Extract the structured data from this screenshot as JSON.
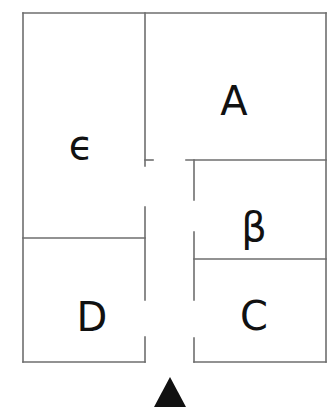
{
  "diagram": {
    "type": "floor-plan",
    "wall_color": "#6e6e6e",
    "label_color": "#111111",
    "marker_color": "#111111",
    "rooms": [
      {
        "id": "A",
        "label": "A",
        "cx": 234,
        "cy": 101
      },
      {
        "id": "B",
        "label": "β",
        "cx": 254,
        "cy": 227
      },
      {
        "id": "C",
        "label": "C",
        "cx": 254,
        "cy": 316
      },
      {
        "id": "D",
        "label": "D",
        "cx": 92,
        "cy": 317
      },
      {
        "id": "E",
        "label": "ϵ",
        "cx": 81,
        "cy": 145
      }
    ],
    "entrance_marker": {
      "shape": "triangle-up",
      "cx": 170,
      "top": 377,
      "bottom": 407
    }
  }
}
